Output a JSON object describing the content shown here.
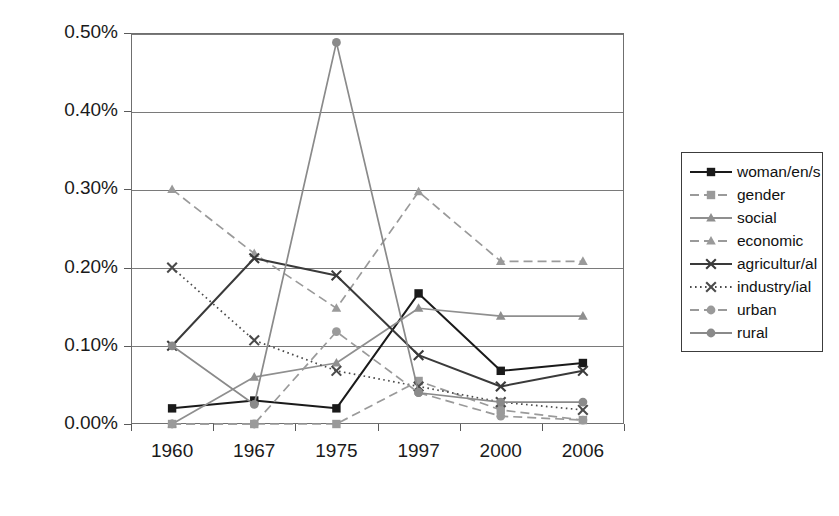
{
  "chart_data": {
    "type": "line",
    "title": "",
    "xlabel": "",
    "ylabel": "",
    "categories": [
      "1960",
      "1967",
      "1975",
      "1997",
      "2000",
      "2006"
    ],
    "ylim": [
      0.0,
      0.5
    ],
    "ytick_labels": [
      "0.00%",
      "0.10%",
      "0.20%",
      "0.30%",
      "0.40%",
      "0.50%"
    ],
    "ytick_values": [
      0.0,
      0.1,
      0.2,
      0.3,
      0.4,
      0.5
    ],
    "yaxis_unit": "%",
    "grid": true,
    "legend_position": "right",
    "series": [
      {
        "name": "woman/en/s",
        "color": "#1a1a1a",
        "dash": "solid",
        "marker": "square",
        "values": [
          0.02,
          0.03,
          0.02,
          0.167,
          0.068,
          0.078
        ]
      },
      {
        "name": "gender",
        "color": "#9a9a9a",
        "dash": "dashed",
        "marker": "square",
        "values": [
          0.0,
          0.0,
          0.0,
          0.055,
          0.018,
          0.005
        ]
      },
      {
        "name": "social",
        "color": "#8f8f8f",
        "dash": "solid",
        "marker": "triangle",
        "values": [
          0.0,
          0.06,
          0.078,
          0.148,
          0.138,
          0.138
        ]
      },
      {
        "name": "economic",
        "color": "#9a9a9a",
        "dash": "dashed",
        "marker": "triangle",
        "values": [
          0.3,
          0.218,
          0.148,
          0.297,
          0.208,
          0.208
        ]
      },
      {
        "name": "agricultur/al",
        "color": "#3a3a3a",
        "dash": "solid",
        "marker": "x",
        "values": [
          0.1,
          0.212,
          0.19,
          0.088,
          0.048,
          0.068
        ]
      },
      {
        "name": "industry/ial",
        "color": "#4a4a4a",
        "dash": "dotted",
        "marker": "x",
        "values": [
          0.2,
          0.107,
          0.068,
          0.048,
          0.028,
          0.018
        ]
      },
      {
        "name": "urban",
        "color": "#9a9a9a",
        "dash": "dashed",
        "marker": "circle",
        "values": [
          0.0,
          0.0,
          0.118,
          0.04,
          0.01,
          0.005
        ]
      },
      {
        "name": "rural",
        "color": "#8a8a8a",
        "dash": "solid",
        "marker": "circle",
        "values": [
          0.1,
          0.025,
          0.488,
          0.04,
          0.028,
          0.028
        ]
      }
    ]
  }
}
